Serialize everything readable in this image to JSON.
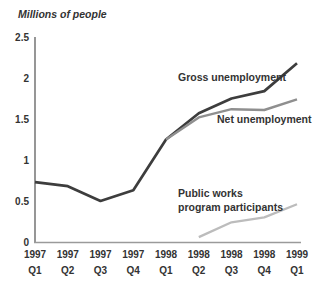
{
  "page": {
    "background": "#ffffff"
  },
  "chart_data": {
    "type": "line",
    "title": "Millions of people",
    "xlabel": "",
    "ylabel": "Millions of people",
    "ylim": [
      0,
      2.5
    ],
    "grid": false,
    "legend_position": "inline-annotations",
    "y_ticks": [
      {
        "value": 0,
        "label": "0"
      },
      {
        "value": 0.5,
        "label": "0.5"
      },
      {
        "value": 1,
        "label": "1"
      },
      {
        "value": 1.5,
        "label": "1.5"
      },
      {
        "value": 2,
        "label": "2"
      },
      {
        "value": 2.5,
        "label": "2.5"
      }
    ],
    "x_labels": [
      {
        "year": "1997",
        "quarter": "Q1"
      },
      {
        "year": "1997",
        "quarter": "Q2"
      },
      {
        "year": "1997",
        "quarter": "Q3"
      },
      {
        "year": "1997",
        "quarter": "Q4"
      },
      {
        "year": "1998",
        "quarter": "Q1"
      },
      {
        "year": "1998",
        "quarter": "Q2"
      },
      {
        "year": "1998",
        "quarter": "Q3"
      },
      {
        "year": "1998",
        "quarter": "Q4"
      },
      {
        "year": "1999",
        "quarter": "Q1"
      }
    ],
    "series": [
      {
        "name": "Gross unemployment",
        "color": "#3d3d3d",
        "width": 2.7,
        "values": [
          0.73,
          0.68,
          0.5,
          0.63,
          1.25,
          1.57,
          1.75,
          1.84,
          2.18
        ]
      },
      {
        "name": "Net unemployment",
        "color": "#8f8f8f",
        "width": 2.4,
        "values": [
          null,
          null,
          null,
          null,
          1.25,
          1.52,
          1.62,
          1.61,
          1.74
        ]
      },
      {
        "name": "Public works program participants",
        "color": "#bcbcbc",
        "width": 2.3,
        "values": [
          null,
          null,
          null,
          null,
          null,
          0.06,
          0.24,
          0.3,
          0.46
        ]
      }
    ],
    "annotations": [
      {
        "name": "gross-unemployment-label",
        "lines": [
          "Gross unemployment"
        ],
        "x": 178,
        "y": 81
      },
      {
        "name": "net-unemployment-label",
        "lines": [
          "Net unemployment"
        ],
        "x": 217,
        "y": 123
      },
      {
        "name": "public-works-label",
        "lines": [
          "Public works",
          "program participants"
        ],
        "x": 178,
        "y": 197
      }
    ],
    "colors": {
      "text": "#333333",
      "y_axis": "#5f5f5f",
      "x_axis": "#9a9a9a"
    }
  }
}
